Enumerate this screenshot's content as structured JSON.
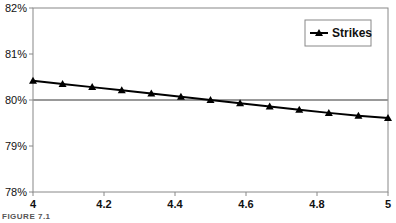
{
  "chart_data": {
    "type": "line",
    "title": "",
    "xlabel": "",
    "ylabel": "",
    "xlim": [
      4,
      5
    ],
    "ylim": [
      78,
      82
    ],
    "x_ticks": [
      4,
      4.2,
      4.4,
      4.6,
      4.8,
      5
    ],
    "x_tick_labels": [
      "4",
      "4.2",
      "4.4",
      "4.6",
      "4.8",
      "5"
    ],
    "y_ticks": [
      78,
      79,
      80,
      81,
      82
    ],
    "y_tick_labels": [
      "78%",
      "79%",
      "80%",
      "81%",
      "82%"
    ],
    "grid": false,
    "reference_line": {
      "y": 80,
      "color": "#999999"
    },
    "legend": {
      "position": "top-right",
      "entries": [
        "Strikes"
      ]
    },
    "series": [
      {
        "name": "Strikes",
        "marker": "triangle",
        "color": "#000000",
        "x": [
          4,
          4.0833,
          4.1667,
          4.25,
          4.3333,
          4.4167,
          4.5,
          4.5833,
          4.6667,
          4.75,
          4.8333,
          4.9167,
          5
        ],
        "values": [
          80.42,
          80.35,
          80.28,
          80.21,
          80.14,
          80.07,
          80.0,
          79.93,
          79.86,
          79.79,
          79.72,
          79.66,
          79.61
        ]
      }
    ]
  },
  "caption": "FIGURE 7.1"
}
